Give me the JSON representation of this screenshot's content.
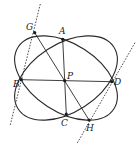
{
  "diagram": {
    "type": "geometry",
    "colors": {
      "stroke": "#2a2a2a",
      "background": "#ffffff"
    },
    "ellipses": [
      {
        "id": "ellipse-1",
        "cx": 66,
        "cy": 78,
        "rx": 57,
        "ry": 34,
        "rotate": 33,
        "through": [
          "G",
          "D",
          "H",
          "B"
        ]
      },
      {
        "id": "ellipse-2",
        "cx": 66,
        "cy": 78,
        "rx": 57,
        "ry": 34,
        "rotate": -33,
        "through": [
          "A",
          "D",
          "C",
          "B"
        ]
      }
    ],
    "points": [
      {
        "id": "G",
        "label": "G",
        "x": 34.7,
        "y": 32.7,
        "lx": 26,
        "ly": 30
      },
      {
        "id": "A",
        "label": "A",
        "x": 62.7,
        "y": 39.3,
        "lx": 59,
        "ly": 34
      },
      {
        "id": "B",
        "label": "B",
        "x": 21.3,
        "y": 79.7,
        "lx": 13,
        "ly": 87
      },
      {
        "id": "P",
        "label": "P",
        "x": 64.7,
        "y": 80.7,
        "lx": 67,
        "ly": 79
      },
      {
        "id": "D",
        "label": "D",
        "x": 111.7,
        "y": 81.7,
        "lx": 114,
        "ly": 85
      },
      {
        "id": "C",
        "label": "C",
        "x": 66.3,
        "y": 114,
        "lx": 61,
        "ly": 126
      },
      {
        "id": "H",
        "label": "H",
        "x": 89,
        "y": 120,
        "lx": 86,
        "ly": 131
      }
    ],
    "segments": [
      {
        "from": "B",
        "to": "D"
      },
      {
        "from": "A",
        "to": "C"
      },
      {
        "from": "G",
        "to": "H"
      }
    ],
    "dashed_lines": [
      {
        "id": "tangent-left",
        "x1": 40.3,
        "y1": 4,
        "x2": 10,
        "y2": 126
      },
      {
        "id": "tangent-right",
        "x1": 135,
        "y1": 42.7,
        "x2": 77.3,
        "y2": 143
      }
    ],
    "labels": [
      "G",
      "A",
      "B",
      "P",
      "D",
      "C",
      "H"
    ]
  }
}
